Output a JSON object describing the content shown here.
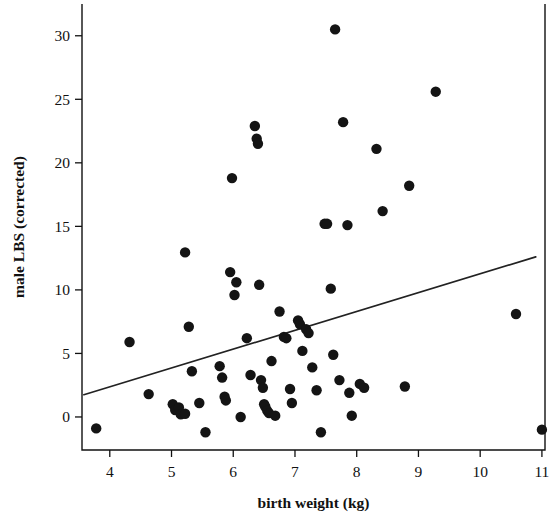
{
  "chart_data": {
    "type": "scatter",
    "title": "",
    "xlabel": "birth weight (kg)",
    "ylabel": "male LBS (corrected)",
    "xlim": [
      3.55,
      11.05
    ],
    "ylim": [
      -2.6,
      32.5
    ],
    "xticks": [
      4,
      5,
      6,
      7,
      8,
      9,
      10,
      11
    ],
    "yticks": [
      0,
      5,
      10,
      15,
      20,
      25,
      30
    ],
    "xtick_labels": [
      "4",
      "5",
      "6",
      "7",
      "8",
      "9",
      "10",
      "11"
    ],
    "ytick_labels": [
      "0",
      "5",
      "10",
      "15",
      "20",
      "25",
      "30"
    ],
    "grid": false,
    "legend": false,
    "marker": "filled-circle",
    "marker_color": "#141414",
    "marker_size_px": 6.2,
    "points": [
      [
        3.78,
        -0.9
      ],
      [
        4.32,
        5.9
      ],
      [
        4.63,
        1.8
      ],
      [
        5.02,
        1.0
      ],
      [
        5.06,
        0.55
      ],
      [
        5.12,
        0.75
      ],
      [
        5.15,
        0.2
      ],
      [
        5.22,
        12.95
      ],
      [
        5.22,
        0.25
      ],
      [
        5.28,
        7.1
      ],
      [
        5.33,
        3.6
      ],
      [
        5.45,
        1.1
      ],
      [
        5.55,
        -1.2
      ],
      [
        5.78,
        4.0
      ],
      [
        5.82,
        3.1
      ],
      [
        5.86,
        1.6
      ],
      [
        5.88,
        1.3
      ],
      [
        5.95,
        11.4
      ],
      [
        5.98,
        18.8
      ],
      [
        6.02,
        9.6
      ],
      [
        6.05,
        10.6
      ],
      [
        6.12,
        0.0
      ],
      [
        6.22,
        6.2
      ],
      [
        6.28,
        3.3
      ],
      [
        6.35,
        22.9
      ],
      [
        6.38,
        21.9
      ],
      [
        6.4,
        21.5
      ],
      [
        6.42,
        10.4
      ],
      [
        6.45,
        2.9
      ],
      [
        6.48,
        2.3
      ],
      [
        6.5,
        1.0
      ],
      [
        6.52,
        0.8
      ],
      [
        6.55,
        0.5
      ],
      [
        6.58,
        0.3
      ],
      [
        6.62,
        4.4
      ],
      [
        6.68,
        0.1
      ],
      [
        6.75,
        8.3
      ],
      [
        6.82,
        6.3
      ],
      [
        6.86,
        6.2
      ],
      [
        6.92,
        2.2
      ],
      [
        6.95,
        1.1
      ],
      [
        7.05,
        7.6
      ],
      [
        7.08,
        7.3
      ],
      [
        7.12,
        5.2
      ],
      [
        7.18,
        6.9
      ],
      [
        7.22,
        6.6
      ],
      [
        7.28,
        3.9
      ],
      [
        7.35,
        2.1
      ],
      [
        7.42,
        -1.2
      ],
      [
        7.48,
        15.2
      ],
      [
        7.52,
        15.2
      ],
      [
        7.58,
        10.1
      ],
      [
        7.62,
        4.9
      ],
      [
        7.65,
        30.5
      ],
      [
        7.72,
        2.9
      ],
      [
        7.78,
        23.2
      ],
      [
        7.85,
        15.1
      ],
      [
        7.88,
        1.9
      ],
      [
        7.92,
        0.1
      ],
      [
        8.05,
        2.6
      ],
      [
        8.12,
        2.3
      ],
      [
        8.32,
        21.1
      ],
      [
        8.42,
        16.2
      ],
      [
        8.78,
        2.4
      ],
      [
        8.85,
        18.2
      ],
      [
        9.28,
        25.6
      ],
      [
        10.58,
        8.1
      ],
      [
        11.0,
        -1.0
      ]
    ],
    "trendline": {
      "visible": true,
      "x_start": 3.58,
      "y_start": 1.75,
      "x_end": 10.9,
      "y_end": 12.6,
      "color": "#222222"
    },
    "axes_style": {
      "frame": "left-bottom-right",
      "tick_direction": "out"
    }
  }
}
